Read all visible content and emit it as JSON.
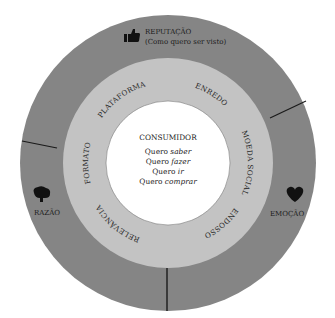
{
  "diagram": {
    "colors": {
      "outer_ring": "#858585",
      "middle_ring": "#c3c3c3",
      "center": "#ffffff",
      "divider": "#1a1a1a",
      "icon": "#111111"
    },
    "center": {
      "title": "CONSUMIDOR",
      "lines": [
        {
          "prefix": "Quero ",
          "emphasis": "saber"
        },
        {
          "prefix": "Quero ",
          "emphasis": "fazer"
        },
        {
          "prefix": "Quero ",
          "emphasis": "ir"
        },
        {
          "prefix": "Quero ",
          "emphasis": "comprar"
        }
      ]
    },
    "middle_ring": {
      "labels": [
        "PLATAFORMA",
        "ENREDO",
        "MOEDA SOCIAL",
        "ENDOSSO",
        "RELEVÂNCIA",
        "FORMATO"
      ]
    },
    "outer_ring": {
      "segments": [
        {
          "label": "REPUTAÇÃO",
          "sublabel": "(Como quero ser visto)",
          "icon": "thumbs-up-icon"
        },
        {
          "label": "EMOÇÃO",
          "icon": "heart-icon"
        },
        {
          "label": "RAZÃO",
          "icon": "brain-icon"
        }
      ]
    }
  }
}
